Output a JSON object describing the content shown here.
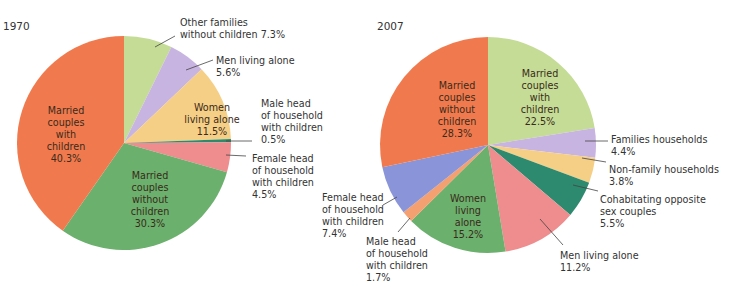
{
  "chart_data": [
    {
      "type": "pie",
      "title": "1970",
      "start_angle_deg": 0,
      "direction": "clockwise",
      "slices": [
        {
          "label": "Other families without children",
          "value": 7.3,
          "color": "#c5dc96"
        },
        {
          "label": "Men living alone",
          "value": 5.6,
          "color": "#c8b4e0"
        },
        {
          "label": "Women living alone",
          "value": 11.5,
          "color": "#f6cf86"
        },
        {
          "label": "Male head of household with children",
          "value": 0.5,
          "color": "#2d8a6e"
        },
        {
          "label": "Female head of household with children",
          "value": 4.5,
          "color": "#ee8c8e"
        },
        {
          "label": "Married couples without children",
          "value": 30.3,
          "color": "#6bb06d"
        },
        {
          "label": "Married couples with children",
          "value": 40.3,
          "color": "#f07a4e"
        }
      ]
    },
    {
      "type": "pie",
      "title": "2007",
      "start_angle_deg": 0,
      "direction": "clockwise",
      "slices": [
        {
          "label": "Married couples with children",
          "value": 22.5,
          "color": "#c5dc96"
        },
        {
          "label": "Families households",
          "value": 4.4,
          "color": "#c8b4e0"
        },
        {
          "label": "Non-family households",
          "value": 3.8,
          "color": "#f6cf86"
        },
        {
          "label": "Cohabitating opposite sex couples",
          "value": 5.5,
          "color": "#2d8a6e"
        },
        {
          "label": "Men living alone",
          "value": 11.2,
          "color": "#ee8c8e"
        },
        {
          "label": "Women living alone",
          "value": 15.2,
          "color": "#6bb06d"
        },
        {
          "label": "Male head of household with children",
          "value": 1.7,
          "color": "#f5a070"
        },
        {
          "label": "Female head of household with children",
          "value": 7.4,
          "color": "#8a94d8"
        },
        {
          "label": "Married couples without children",
          "value": 28.3,
          "color": "#f07a4e"
        }
      ]
    }
  ],
  "charts": {
    "c1970": {
      "title": "1970",
      "labels": {
        "other_families_1": "Other families",
        "other_families_2": "without children 7.3%",
        "men_alone_1": "Men living alone",
        "men_alone_2": "5.6%",
        "women_alone_1": "Women",
        "women_alone_2": "living alone",
        "women_alone_3": "11.5%",
        "male_head_1": "Male head",
        "male_head_2": "of household",
        "male_head_3": "with children",
        "male_head_4": "0.5%",
        "female_head_1": "Female head",
        "female_head_2": "of household",
        "female_head_3": "with children",
        "female_head_4": "4.5%",
        "married_wo_1": "Married",
        "married_wo_2": "couples",
        "married_wo_3": "without",
        "married_wo_4": "children",
        "married_wo_5": "30.3%",
        "married_w_1": "Married",
        "married_w_2": "couples",
        "married_w_3": "with",
        "married_w_4": "children",
        "married_w_5": "40.3%"
      }
    },
    "c2007": {
      "title": "2007",
      "labels": {
        "married_w_1": "Married",
        "married_w_2": "couples",
        "married_w_3": "with",
        "married_w_4": "children",
        "married_w_5": "22.5%",
        "families_1": "Families households",
        "families_2": "4.4%",
        "nonfamily_1": "Non-family households",
        "nonfamily_2": "3.8%",
        "cohab_1": "Cohabitating opposite",
        "cohab_2": "sex couples",
        "cohab_3": "5.5%",
        "men_alone_1": "Men living alone",
        "men_alone_2": "11.2%",
        "women_alone_1": "Women",
        "women_alone_2": "living",
        "women_alone_3": "alone",
        "women_alone_4": "15.2%",
        "male_head_1": "Male head",
        "male_head_2": "of household",
        "male_head_3": "with children",
        "male_head_4": "1.7%",
        "female_head_1": "Female head",
        "female_head_2": "of household",
        "female_head_3": "with children",
        "female_head_4": "7.4%",
        "married_wo_1": "Married",
        "married_wo_2": "couples",
        "married_wo_3": "without",
        "married_wo_4": "children",
        "married_wo_5": "28.3%"
      }
    }
  }
}
